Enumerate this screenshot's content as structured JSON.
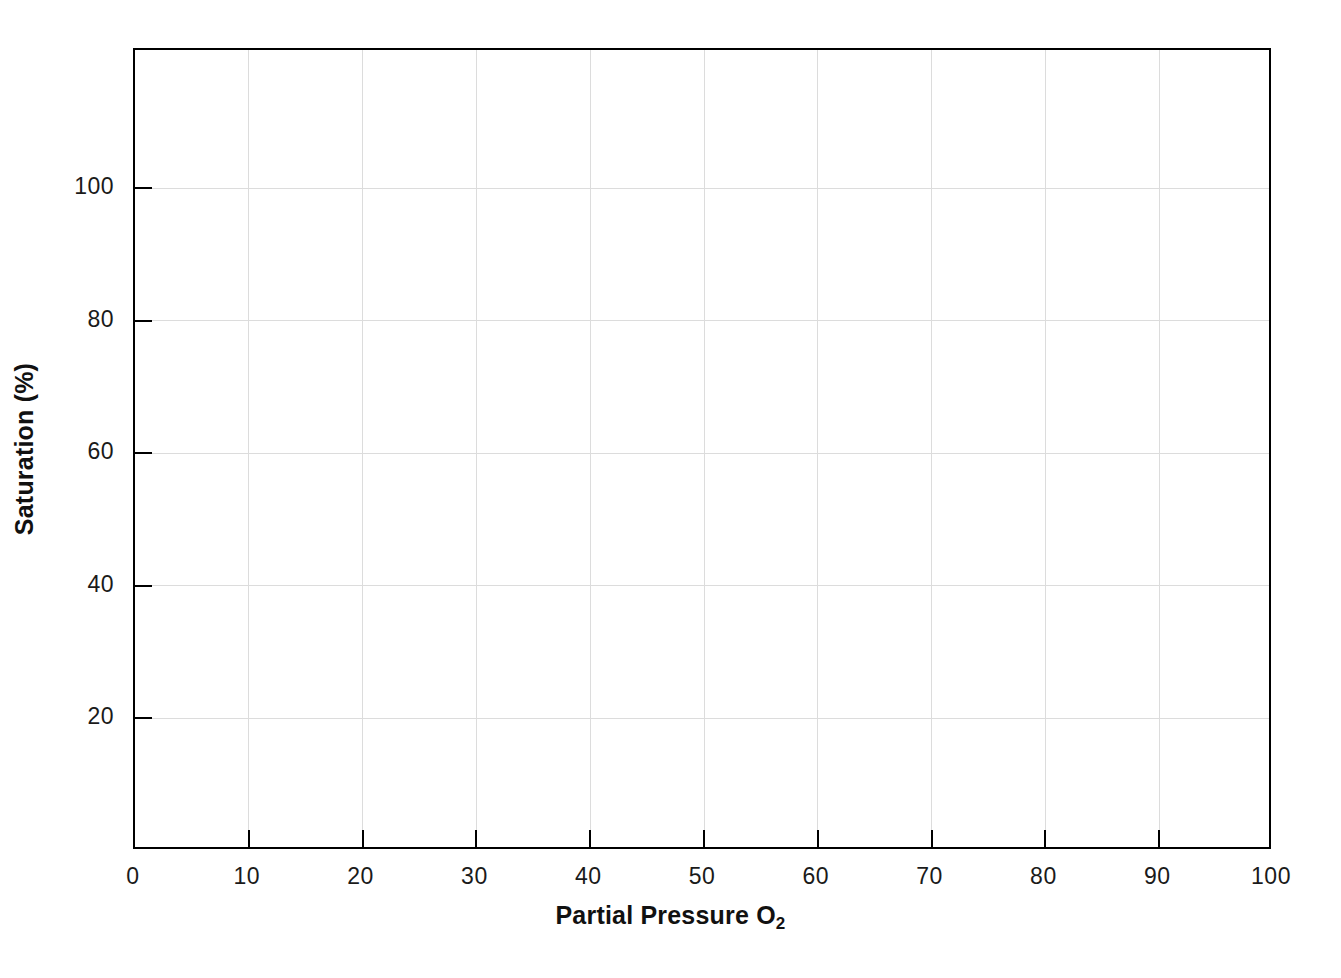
{
  "chart_data": {
    "type": "line",
    "title": "",
    "subtitle": "",
    "xlabel": "Partial Pressure O",
    "xlabel_subscript": "2",
    "xlabel_full": "Partial Pressure O2",
    "ylabel": "Saturation (%)",
    "x_ticks": [
      0,
      10,
      20,
      30,
      40,
      50,
      60,
      70,
      80,
      90,
      100
    ],
    "x_tick_labels": [
      "0",
      "10",
      "20",
      "30",
      "40",
      "50",
      "60",
      "70",
      "80",
      "90",
      "100"
    ],
    "y_ticks": [
      20,
      40,
      60,
      80,
      100
    ],
    "y_tick_labels": [
      "20",
      "40",
      "60",
      "80",
      "100"
    ],
    "xlim": [
      0,
      100
    ],
    "ylim": [
      0,
      120.9
    ],
    "grid": true,
    "grid_color": "#dcdcdc",
    "axis_color": "#000000",
    "legend": false,
    "legend_position": "none",
    "series": [],
    "annotations": [],
    "note": "Blank axes template — no data plotted in the plot area"
  },
  "colors": {
    "background": "#ffffff",
    "axis": "#000000",
    "grid": "#dcdcdc",
    "text": "#1a1a1a",
    "label": "#111111"
  }
}
